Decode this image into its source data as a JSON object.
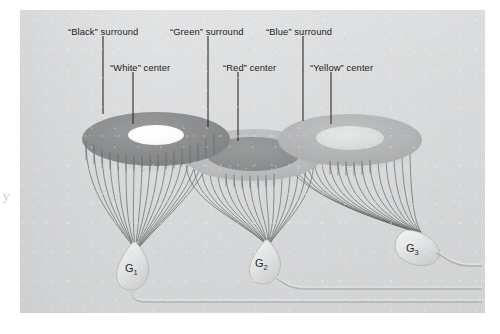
{
  "figure": {
    "background_color": "#ffffff",
    "panel_color": "#d9dadb",
    "ink_color": "#1c1c1c",
    "page_artifact": "y"
  },
  "labels": [
    {
      "id": "black-surround",
      "text": "“Black” surround",
      "x": 68,
      "y": 26
    },
    {
      "id": "green-surround",
      "text": "“Green” surround",
      "x": 170,
      "y": 26
    },
    {
      "id": "blue-surround",
      "text": "“Blue” surround",
      "x": 266,
      "y": 26
    },
    {
      "id": "white-center",
      "text": "“White” center",
      "x": 110,
      "y": 62
    },
    {
      "id": "red-center",
      "text": "“Red” center",
      "x": 223,
      "y": 62
    },
    {
      "id": "yellow-center",
      "text": "“Yellow” center",
      "x": 310,
      "y": 62
    }
  ],
  "leader_lines": [
    {
      "id": "leader-black-surround",
      "x1": 103,
      "y1": 36,
      "x2": 103,
      "y2": 114
    },
    {
      "id": "leader-white-center",
      "x1": 133,
      "y1": 72,
      "x2": 133,
      "y2": 124
    },
    {
      "id": "leader-green-surround",
      "x1": 208,
      "y1": 36,
      "x2": 208,
      "y2": 127
    },
    {
      "id": "leader-red-center",
      "x1": 238,
      "y1": 72,
      "x2": 238,
      "y2": 141
    },
    {
      "id": "leader-blue-surround",
      "x1": 303,
      "y1": 36,
      "x2": 303,
      "y2": 121
    },
    {
      "id": "leader-yellow-center",
      "x1": 331,
      "y1": 72,
      "x2": 331,
      "y2": 124
    }
  ],
  "receptive_fields": [
    {
      "id": "field-1",
      "surround_label": "“Black” surround",
      "center_label": "“White” center",
      "cx": 136,
      "cy": 129,
      "rx": 74,
      "ry": 27,
      "center_rx": 28,
      "center_ry": 10,
      "center_offset_y": -4,
      "surround_color": "#8c8d8e",
      "center_color": "#fbfbfb",
      "type": "annulus"
    },
    {
      "id": "field-2",
      "surround_label": "“Green” surround",
      "center_label": "“Red” center",
      "cx": 233,
      "cy": 145,
      "rx": 70,
      "ry": 26,
      "center_rx": 47,
      "center_ry": 17,
      "center_offset_y": -1,
      "surround_color": "#bcbdbe",
      "center_color": "#909192",
      "type": "annulus"
    },
    {
      "id": "field-3",
      "surround_label": "“Blue” surround",
      "center_label": "“Yellow” center",
      "cx": 330,
      "cy": 130,
      "rx": 72,
      "ry": 26,
      "center_rx": 34,
      "center_ry": 12,
      "center_offset_y": -2,
      "surround_color": "#b4b5b6",
      "center_color": "#dcdddd",
      "type": "annulus"
    }
  ],
  "ganglion_cells": [
    {
      "id": "cell-g1",
      "label": "G",
      "subscript": "1",
      "label_x": 110,
      "label_y": 256,
      "soma_x": 115,
      "soma_y": 255
    },
    {
      "id": "cell-g2",
      "label": "G",
      "subscript": "2",
      "label_x": 243,
      "label_y": 252,
      "soma_x": 247,
      "soma_y": 251
    },
    {
      "id": "cell-g3",
      "label": "G",
      "subscript": "3",
      "label_x": 400,
      "label_y": 235,
      "soma_x": 404,
      "soma_y": 234
    }
  ],
  "fiber_bundles": [
    {
      "id": "bundle-1",
      "cell": "G1",
      "fiber_count": 17,
      "converge_x": 115,
      "converge_y": 236
    },
    {
      "id": "bundle-2",
      "cell": "G2",
      "fiber_count": 17,
      "converge_x": 247,
      "converge_y": 233
    },
    {
      "id": "bundle-3",
      "cell": "G3",
      "fiber_count": 17,
      "converge_x": 399,
      "converge_y": 222
    }
  ],
  "axons": [
    {
      "id": "axon-g1",
      "from": "G1"
    },
    {
      "id": "axon-g2",
      "from": "G2"
    },
    {
      "id": "axon-g3",
      "from": "G3"
    }
  ]
}
